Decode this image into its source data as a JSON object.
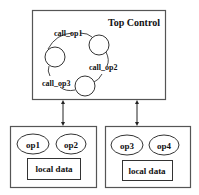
{
  "diagram": {
    "top_control": {
      "title": "Top Control",
      "states": [
        {
          "id": "s1",
          "cx": 55,
          "cy": 57,
          "r": 10
        },
        {
          "id": "s2",
          "cx": 99,
          "cy": 45,
          "r": 10
        },
        {
          "id": "s3",
          "cx": 85,
          "cy": 86,
          "r": 10
        }
      ],
      "transitions": [
        {
          "label": "call_op1",
          "from": "s1",
          "to": "s2"
        },
        {
          "label": "call_op2",
          "from": "s2",
          "to": "s3"
        },
        {
          "label": "call_op3",
          "from": "s3",
          "to": "s1"
        }
      ]
    },
    "modules": [
      {
        "name": "left-module",
        "ops": [
          "op1",
          "op2"
        ],
        "data_label": "local data"
      },
      {
        "name": "right-module",
        "ops": [
          "op3",
          "op4"
        ],
        "data_label": "local data"
      }
    ],
    "connections": [
      {
        "from": "top-control",
        "to": "left-module",
        "type": "bidirectional"
      },
      {
        "from": "top-control",
        "to": "right-module",
        "type": "bidirectional"
      }
    ]
  }
}
